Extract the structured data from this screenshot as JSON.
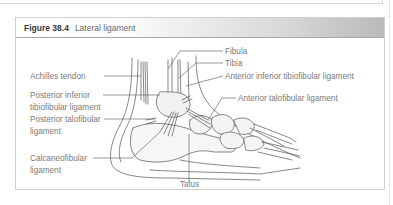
{
  "figure": {
    "number": "Figure 38.4",
    "title": "Lateral ligament"
  },
  "labels": {
    "fibula": "Fibula",
    "tibia": "Tibia",
    "anterior_inferior_tibiofibular": "Anterior inferior tibiofibular ligament",
    "anterior_talofibular": "Anterior talofibular ligament",
    "achilles": "Achilles tendon",
    "posterior_inferior_tibiofibular_1": "Posterior inferior",
    "posterior_inferior_tibiofibular_2": "tibiofibular ligament",
    "posterior_talofibular_1": "Posterior talofibular",
    "posterior_talofibular_2": "ligament",
    "calcaneofibular_1": "Calcaneofibular",
    "calcaneofibular_2": "ligament",
    "talus": "Talus"
  },
  "colors": {
    "line": "#555555",
    "label_text": "#7a7a7a",
    "header_gradient_end": "#b9b9b9"
  }
}
